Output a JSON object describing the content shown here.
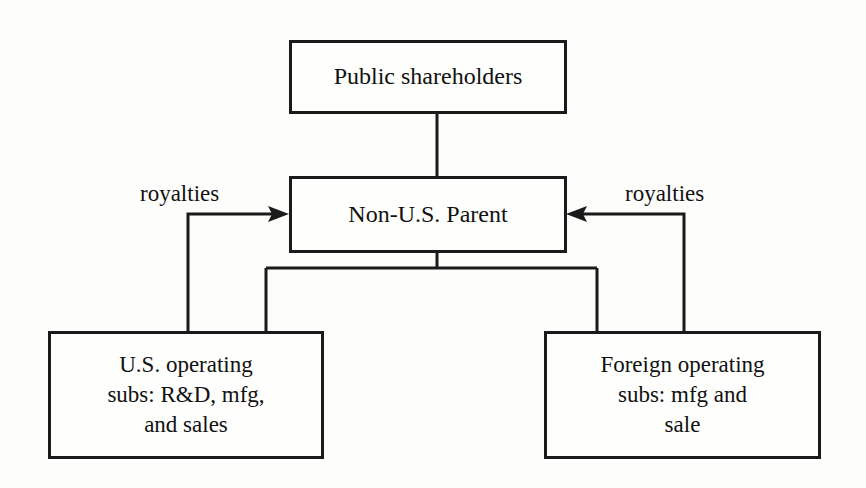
{
  "diagram": {
    "type": "organization-structure-flow",
    "background_color": "#fdfdfb",
    "line_color": "#1a1a1a",
    "text_color": "#111111",
    "nodes": [
      {
        "id": "public-shareholders",
        "label": "Public shareholders",
        "role": "owner"
      },
      {
        "id": "non-us-parent",
        "label": "Non-U.S. Parent",
        "role": "parent"
      },
      {
        "id": "us-operating-subs",
        "label": "U.S. operating\nsubs: R&D, mfg,\nand sales",
        "role": "subsidiary"
      },
      {
        "id": "foreign-operating-subs",
        "label": "Foreign operating\nsubs: mfg and\nsale",
        "role": "subsidiary"
      }
    ],
    "edges": [
      {
        "id": "shareholders-to-parent",
        "from": "public-shareholders",
        "to": "non-us-parent",
        "label": "",
        "arrow": false
      },
      {
        "id": "parent-to-us-subs",
        "from": "non-us-parent",
        "to": "us-operating-subs",
        "label": "",
        "arrow": false
      },
      {
        "id": "parent-to-foreign-subs",
        "from": "non-us-parent",
        "to": "foreign-operating-subs",
        "label": "",
        "arrow": false
      },
      {
        "id": "us-subs-royalties-to-parent",
        "from": "us-operating-subs",
        "to": "non-us-parent",
        "label": "royalties",
        "arrow": true
      },
      {
        "id": "foreign-subs-royalties-to-parent",
        "from": "foreign-operating-subs",
        "to": "non-us-parent",
        "label": "royalties",
        "arrow": true
      }
    ]
  }
}
